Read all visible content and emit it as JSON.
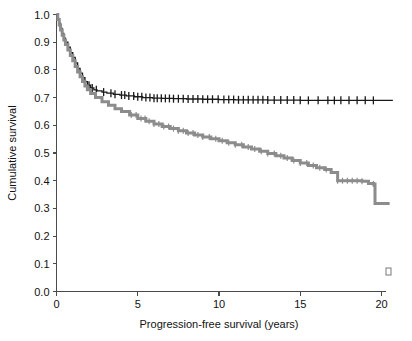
{
  "figure": {
    "background_color": "#ffffff",
    "corner_mark": "▫"
  },
  "chart_data": {
    "type": "line",
    "title": "",
    "subtitle": "",
    "xlabel": "Progression-free survival (years)",
    "ylabel": "Cumulative survival",
    "xlim": [
      0,
      21
    ],
    "ylim": [
      0.0,
      1.0
    ],
    "xticks": [
      0,
      5,
      10,
      15,
      20
    ],
    "xticklabels": [
      "0",
      "5",
      "10",
      "15",
      "20"
    ],
    "yticks": [
      0.0,
      0.1,
      0.2,
      0.3,
      0.4,
      0.5,
      0.6,
      0.7,
      0.8,
      0.9,
      1.0
    ],
    "yticklabels": [
      "0.0",
      "0.1",
      "0.2",
      "0.3",
      "0.4",
      "0.5",
      "0.6",
      "0.7",
      "0.8",
      "0.9",
      "1.0"
    ],
    "grid": false,
    "legend": null,
    "legend_position": "none",
    "annotations": [],
    "series": [
      {
        "name": "upper-curve-black",
        "color": "#1a1a1a",
        "line_width": 1.3,
        "censor_marker": "vertical-tick",
        "x": [
          0,
          0.08,
          0.17,
          0.25,
          0.35,
          0.45,
          0.55,
          0.7,
          0.85,
          1.0,
          1.15,
          1.3,
          1.45,
          1.6,
          1.75,
          1.9,
          2.1,
          2.3,
          2.5,
          2.8,
          3.1,
          3.5,
          3.9,
          4.3,
          4.8,
          5.3,
          5.9,
          6.5,
          7.2,
          8.0,
          9.0,
          10.0,
          11.0,
          12.0,
          13.0,
          14.0,
          15.0,
          16.0,
          17.0,
          18.0,
          19.0,
          20.0,
          20.7
        ],
        "y": [
          1.0,
          0.985,
          0.968,
          0.95,
          0.932,
          0.915,
          0.9,
          0.882,
          0.862,
          0.845,
          0.825,
          0.805,
          0.788,
          0.772,
          0.758,
          0.745,
          0.735,
          0.728,
          0.724,
          0.72,
          0.716,
          0.712,
          0.709,
          0.706,
          0.703,
          0.7,
          0.698,
          0.697,
          0.696,
          0.695,
          0.694,
          0.693,
          0.692,
          0.692,
          0.691,
          0.691,
          0.69,
          0.69,
          0.69,
          0.69,
          0.69,
          0.69,
          0.69
        ],
        "censor_x": [
          2.0,
          2.2,
          2.45,
          2.9,
          3.35,
          3.6,
          4.0,
          4.2,
          4.45,
          4.75,
          5.0,
          5.25,
          5.5,
          5.75,
          6.0,
          6.2,
          6.45,
          6.7,
          6.95,
          7.2,
          7.5,
          7.8,
          8.1,
          8.4,
          8.7,
          9.0,
          9.3,
          9.6,
          9.95,
          10.3,
          10.6,
          10.9,
          11.2,
          11.5,
          11.8,
          12.1,
          12.4,
          12.7,
          13.0,
          13.4,
          13.8,
          14.2,
          14.6,
          15.0,
          15.5,
          16.1,
          16.7,
          17.1,
          17.5,
          18.0,
          18.5,
          19.0,
          19.5
        ]
      },
      {
        "name": "lower-curve-gray",
        "color": "#8c8c8c",
        "line_width": 3.0,
        "censor_marker": "vertical-tick",
        "x": [
          0,
          0.08,
          0.17,
          0.25,
          0.35,
          0.45,
          0.55,
          0.7,
          0.85,
          1.0,
          1.15,
          1.3,
          1.45,
          1.6,
          1.75,
          1.9,
          2.1,
          2.4,
          2.8,
          3.2,
          3.6,
          4.0,
          4.5,
          5.0,
          5.5,
          6.0,
          6.5,
          7.0,
          7.5,
          8.0,
          8.5,
          9.0,
          9.5,
          10.0,
          10.5,
          11.0,
          11.5,
          12.0,
          12.5,
          13.0,
          13.5,
          14.0,
          14.5,
          15.0,
          15.5,
          16.0,
          16.5,
          16.9,
          17.3,
          17.8,
          18.3,
          18.8,
          19.2,
          19.5,
          19.6,
          20.5
        ],
        "y": [
          1.0,
          0.982,
          0.962,
          0.944,
          0.925,
          0.908,
          0.892,
          0.872,
          0.852,
          0.833,
          0.812,
          0.792,
          0.775,
          0.758,
          0.742,
          0.728,
          0.715,
          0.7,
          0.685,
          0.672,
          0.66,
          0.65,
          0.637,
          0.625,
          0.615,
          0.605,
          0.596,
          0.588,
          0.58,
          0.572,
          0.565,
          0.558,
          0.551,
          0.544,
          0.537,
          0.53,
          0.522,
          0.514,
          0.506,
          0.498,
          0.49,
          0.482,
          0.473,
          0.464,
          0.455,
          0.447,
          0.44,
          0.43,
          0.4,
          0.4,
          0.4,
          0.398,
          0.39,
          0.388,
          0.318,
          0.318
        ],
        "censor_x": [
          4.6,
          4.9,
          5.2,
          5.45,
          5.7,
          6.0,
          6.3,
          6.6,
          6.9,
          7.2,
          7.5,
          7.8,
          8.1,
          8.4,
          8.7,
          9.0,
          9.4,
          9.8,
          10.2,
          10.6,
          11.0,
          11.4,
          11.8,
          12.2,
          12.6,
          13.0,
          13.4,
          13.8,
          14.2,
          14.6,
          15.0,
          15.4,
          15.8,
          16.2,
          16.6,
          17.3,
          17.6,
          17.9,
          18.2,
          18.5,
          18.8,
          19.5
        ]
      }
    ]
  }
}
